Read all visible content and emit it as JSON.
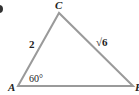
{
  "figure": {
    "type": "triangle",
    "vertices": {
      "A": {
        "label": "A"
      },
      "B": {
        "label": "B"
      },
      "C": {
        "label": "C"
      }
    },
    "sides": {
      "AC": {
        "label": "2"
      },
      "BC": {
        "label": "√6"
      }
    },
    "angles": {
      "A": {
        "label": "60°"
      }
    },
    "colors": {
      "stroke": "#9a9a9a",
      "text": "#222222",
      "marker": "#333333"
    }
  }
}
